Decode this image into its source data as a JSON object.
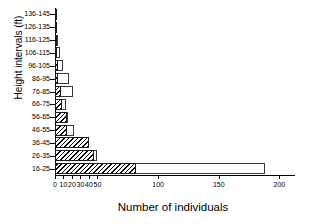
{
  "chart_data": {
    "type": "bar",
    "orientation": "horizontal",
    "title": "",
    "xlabel": "Number of individuals",
    "ylabel": "Height intervals (ft)",
    "categories": [
      "16-25",
      "26-35",
      "36-45",
      "46-55",
      "56-65",
      "66-75",
      "76-85",
      "86-95",
      "96-105",
      "106-115",
      "116-125",
      "126-135",
      "136-145"
    ],
    "xticks": [
      0,
      10,
      20,
      30,
      40,
      50,
      100,
      150,
      200
    ],
    "xtick_labels": [
      "0",
      "10",
      "20",
      "30",
      "40",
      "50",
      "100",
      "150",
      "200"
    ],
    "xlim": [
      0,
      210
    ],
    "xscale": "compressed",
    "grid": false,
    "legend": "none",
    "series": [
      {
        "name": "outlined",
        "style": "white-outline",
        "values": [
          188,
          50,
          26,
          22,
          15,
          13,
          21,
          17,
          10,
          6,
          4,
          2,
          2
        ]
      },
      {
        "name": "hatched",
        "style": "diagonal-hatch",
        "values": [
          82,
          46,
          40,
          14,
          14,
          8,
          7,
          4,
          4,
          2,
          1,
          1,
          1
        ]
      }
    ]
  },
  "axes": {
    "y_title": "Height intervals (ft)",
    "x_title": "Number of individuals"
  }
}
